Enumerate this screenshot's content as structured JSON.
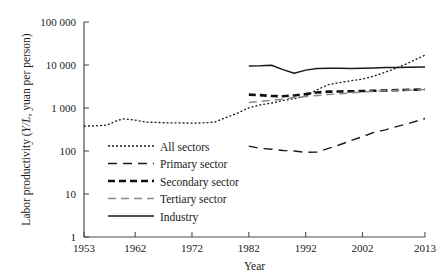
{
  "chart_data": {
    "type": "line",
    "title": "",
    "xlabel": "Year",
    "ylabel": "Labor productivity (Y/L, yuan per person)",
    "ylabel_parts": {
      "prefix": "Labor productivity (",
      "italic": "Y/L",
      "suffix": ", yuan per person)"
    },
    "yscale": "log",
    "ylim": [
      1,
      100000
    ],
    "xlim": [
      1953,
      2013
    ],
    "grid": false,
    "legend_position": "inside-lower-left",
    "ytick_labels": [
      "100 000",
      "10 000",
      "1 000",
      "100",
      "10",
      "1"
    ],
    "ytick_values": [
      100000,
      10000,
      1000,
      100,
      10,
      1
    ],
    "xtick_labels": [
      "1953",
      "1962",
      "1972",
      "1982",
      "1992",
      "2002",
      "2013"
    ],
    "xtick_values": [
      1953,
      1962,
      1972,
      1982,
      1992,
      2002,
      2013
    ],
    "series": [
      {
        "name": "All sectors",
        "style": "dotted",
        "color": "#1a1a1a",
        "width": 1.3,
        "dash": "2,2",
        "x": [
          1953,
          1955,
          1957,
          1959,
          1960,
          1962,
          1964,
          1966,
          1968,
          1970,
          1972,
          1974,
          1976,
          1978,
          1980,
          1982,
          1984,
          1986,
          1988,
          1990,
          1992,
          1994,
          1996,
          1998,
          2000,
          2002,
          2004,
          2006,
          2008,
          2010,
          2013
        ],
        "values": [
          380,
          385,
          400,
          520,
          560,
          520,
          470,
          460,
          450,
          450,
          445,
          450,
          470,
          600,
          760,
          1010,
          1180,
          1300,
          1500,
          1650,
          1900,
          2650,
          3500,
          3900,
          4300,
          4700,
          5500,
          6800,
          8500,
          11000,
          17000
        ]
      },
      {
        "name": "Primary sector",
        "style": "long-dash",
        "color": "#1a1a1a",
        "width": 1.4,
        "dash": "9,6",
        "x": [
          1982,
          1984,
          1986,
          1988,
          1990,
          1992,
          1994,
          1996,
          1998,
          2000,
          2002,
          2004,
          2006,
          2008,
          2010,
          2013
        ],
        "values": [
          130,
          115,
          110,
          103,
          100,
          93,
          95,
          115,
          140,
          175,
          215,
          270,
          310,
          370,
          430,
          570
        ]
      },
      {
        "name": "Secondary sector",
        "style": "thick-dash",
        "color": "#111111",
        "width": 2.6,
        "dash": "7,4",
        "x": [
          1982,
          1984,
          1986,
          1988,
          1990,
          1992,
          1994,
          1996,
          1998,
          2000,
          2002,
          2004,
          2006,
          2008,
          2010,
          2013
        ],
        "values": [
          2050,
          1990,
          1900,
          1880,
          1960,
          2100,
          2300,
          2400,
          2420,
          2450,
          2480,
          2520,
          2550,
          2600,
          2650,
          2700
        ]
      },
      {
        "name": "Tertiary sector",
        "style": "gray-dash",
        "color": "#8a8a8a",
        "width": 1.5,
        "dash": "8,5",
        "x": [
          1982,
          1984,
          1986,
          1988,
          1990,
          1992,
          1994,
          1996,
          1998,
          2000,
          2002,
          2004,
          2006,
          2008,
          2010,
          2013
        ],
        "values": [
          1350,
          1420,
          1500,
          1600,
          1750,
          1850,
          1950,
          2050,
          2150,
          2250,
          2350,
          2450,
          2520,
          2580,
          2620,
          2680
        ]
      },
      {
        "name": "Industry",
        "style": "solid",
        "color": "#1a1a1a",
        "width": 1.5,
        "dash": "none",
        "x": [
          1982,
          1984,
          1986,
          1988,
          1990,
          1992,
          1994,
          1996,
          1998,
          2000,
          2002,
          2004,
          2006,
          2008,
          2010,
          2013
        ],
        "values": [
          9500,
          9600,
          9900,
          7800,
          6400,
          7600,
          8300,
          8400,
          8350,
          8300,
          8400,
          8500,
          8700,
          8800,
          8900,
          9000
        ]
      }
    ]
  },
  "legend": {
    "items": [
      {
        "label": "All sectors"
      },
      {
        "label": "Primary sector"
      },
      {
        "label": "Secondary sector"
      },
      {
        "label": "Tertiary sector"
      },
      {
        "label": "Industry"
      }
    ]
  }
}
